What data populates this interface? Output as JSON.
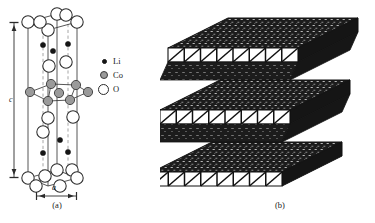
{
  "figure": {
    "panels": [
      {
        "id": "a",
        "caption": "(a)",
        "description": "LiCoO2 hexagonal unit cell with atoms",
        "dimension_labels": {
          "vertical": "c",
          "horizontal": "a"
        }
      },
      {
        "id": "b",
        "caption": "(b)",
        "description": "Layered CoO6 octahedral slab representation"
      }
    ],
    "legend": {
      "items": [
        {
          "symbol": "Li",
          "marker": "small-black-filled-circle",
          "color": "#151515"
        },
        {
          "symbol": "Co",
          "marker": "medium-gray-filled-circle",
          "color": "#9a9a9a"
        },
        {
          "symbol": "O",
          "marker": "large-open-circle",
          "color": "#ffffff"
        }
      ]
    },
    "colors": {
      "background": "#ffffff",
      "line": "#2b2b2b",
      "dashed_line": "#8a8a8a",
      "slab_fill": "#1c1c1c",
      "facet_fill": "#ffffff"
    }
  }
}
